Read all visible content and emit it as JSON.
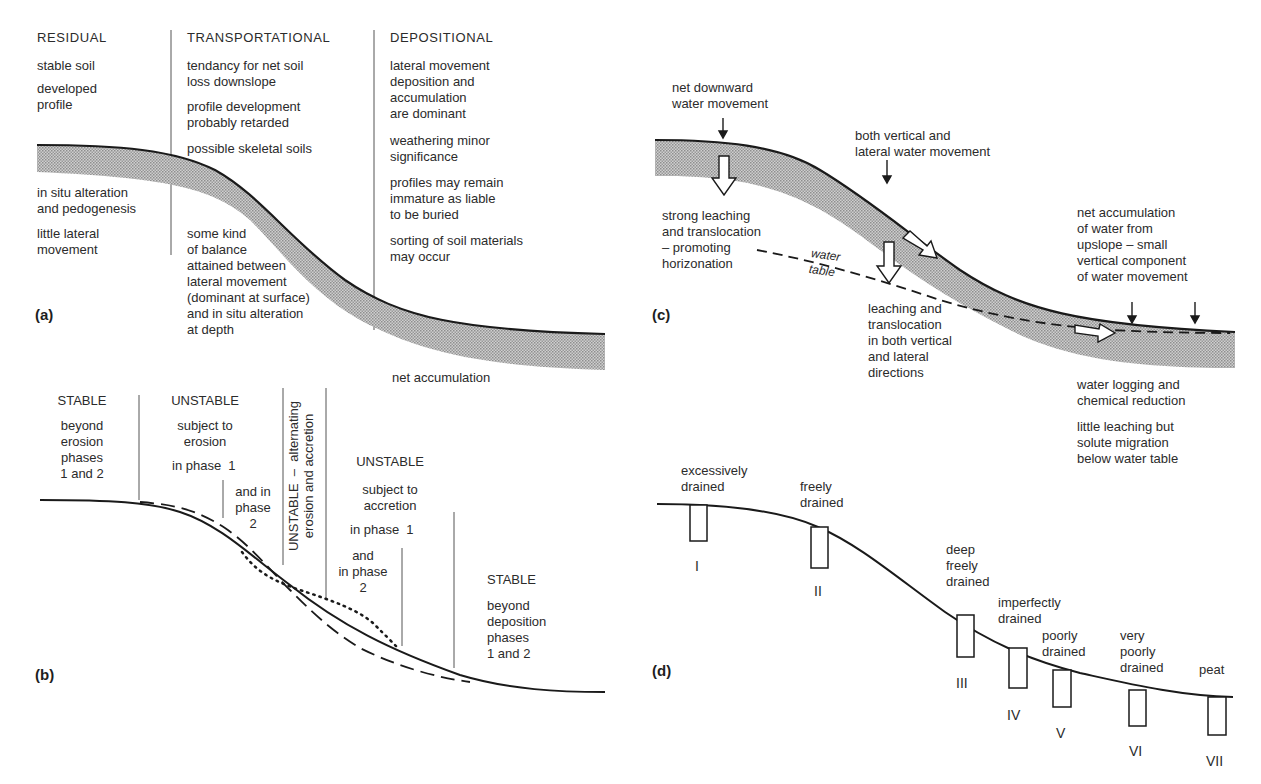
{
  "panels": {
    "a": {
      "label": "(a)",
      "residual": {
        "heading": "RESIDUAL",
        "notes": [
          "stable soil",
          "developed\nprofile"
        ],
        "lower_notes": [
          "in situ alteration\nand pedogenesis",
          "little lateral\nmovement"
        ]
      },
      "transportational": {
        "heading": "TRANSPORTATIONAL",
        "notes": [
          "tendancy for net soil\nloss downslope",
          "profile development\nprobably retarded",
          "possible skeletal soils"
        ],
        "lower_note": "some kind\nof balance\nattained between\nlateral movement\n(dominant at surface)\nand in situ alteration\nat depth"
      },
      "depositional": {
        "heading": "DEPOSITIONAL",
        "notes": [
          "lateral movement\ndeposition and\naccumulation\nare dominant",
          "weathering minor\nsignificance",
          "profiles may remain\nimmature as liable\nto be buried",
          "sorting of soil materials\nmay occur"
        ],
        "bottom_note": "net accumulation"
      }
    },
    "b": {
      "label": "(b)",
      "zones": [
        {
          "heading": "STABLE",
          "text": "beyond\nerosion\nphases\n1 and 2"
        },
        {
          "heading": "UNSTABLE",
          "text": "subject to\nerosion",
          "phase1": "in phase  1",
          "phase2": "and in\nphase\n2"
        },
        {
          "vertical_text": "UNSTABLE  –  alternating\nerosion and accretion"
        },
        {
          "heading": "UNSTABLE",
          "text": "subject to\naccretion",
          "phase1": "in phase  1",
          "phase2": "and\nin phase\n2"
        },
        {
          "heading": "STABLE",
          "text": "beyond\ndeposition\nphases\n1 and 2"
        }
      ]
    },
    "c": {
      "label": "(c)",
      "notes": {
        "top_left": "net downward\nwater movement",
        "top_mid": "both vertical and\nlateral water movement",
        "left": "strong leaching\nand translocation\n– promoting\nhorizonation",
        "water_table": "water\ntable",
        "mid": "leaching and\ntranslocation\nin both vertical\nand lateral\ndirections",
        "right": "net accumulation\nof water from\nupslope – small\nvertical component\nof water movement",
        "bottom_right_1": "water logging and\nchemical reduction",
        "bottom_right_2": "little leaching but\nsolute migration\nbelow water table"
      }
    },
    "d": {
      "label": "(d)",
      "profiles": [
        {
          "numeral": "I",
          "label": "excessively\ndrained"
        },
        {
          "numeral": "II",
          "label": "freely\ndrained"
        },
        {
          "numeral": "III",
          "label": "deep\nfreely\ndrained"
        },
        {
          "numeral": "IV",
          "label": "imperfectly\ndrained"
        },
        {
          "numeral": "V",
          "label": "poorly\ndrained"
        },
        {
          "numeral": "VI",
          "label": "very\npoorly\ndrained"
        },
        {
          "numeral": "VII",
          "label": "peat"
        }
      ]
    }
  },
  "colors": {
    "ink": "#1e1e1e",
    "shade": "#b8b8b8",
    "background": "#ffffff"
  }
}
